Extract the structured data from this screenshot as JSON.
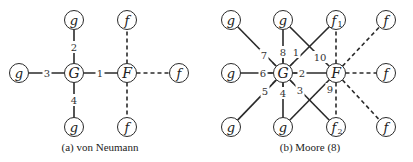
{
  "panels": [
    {
      "id": "a",
      "caption": "(a)  von Neumann",
      "caption_pos": [
        100,
        148
      ],
      "nodes": [
        {
          "id": "g_top",
          "label": "g",
          "x": 74,
          "y": 20
        },
        {
          "id": "g_left",
          "label": "g",
          "x": 19,
          "y": 73
        },
        {
          "id": "G",
          "label": "G",
          "x": 74,
          "y": 73,
          "big": true
        },
        {
          "id": "g_bottom",
          "label": "g",
          "x": 74,
          "y": 127
        },
        {
          "id": "F",
          "label": "F",
          "x": 127,
          "y": 73,
          "big": true
        },
        {
          "id": "f_top",
          "label": "f",
          "x": 127,
          "y": 20
        },
        {
          "id": "f_right",
          "label": "f",
          "x": 179,
          "y": 73
        },
        {
          "id": "f_bottom",
          "label": "f",
          "x": 127,
          "y": 127
        }
      ],
      "edges": [
        {
          "from": "G",
          "to": "F",
          "style": "solid",
          "label": "1",
          "lx": 100,
          "ly": 73
        },
        {
          "from": "G",
          "to": "g_top",
          "style": "solid",
          "label": "2",
          "lx": 74,
          "ly": 47
        },
        {
          "from": "G",
          "to": "g_left",
          "style": "solid",
          "label": "3",
          "lx": 47,
          "ly": 73
        },
        {
          "from": "G",
          "to": "g_bottom",
          "style": "solid",
          "label": "4",
          "lx": 74,
          "ly": 100
        },
        {
          "from": "F",
          "to": "f_top",
          "style": "dashed"
        },
        {
          "from": "F",
          "to": "f_right",
          "style": "dashed"
        },
        {
          "from": "F",
          "to": "f_bottom",
          "style": "dashed"
        }
      ]
    },
    {
      "id": "b",
      "caption": "(b)  Moore (8)",
      "caption_pos": [
        310,
        148
      ],
      "nodes": [
        {
          "id": "g_tl",
          "label": "g",
          "x": 231,
          "y": 20
        },
        {
          "id": "g_tm",
          "label": "g",
          "x": 283,
          "y": 20
        },
        {
          "id": "f1",
          "label": "f",
          "sub": "1",
          "x": 336,
          "y": 20
        },
        {
          "id": "f_tr",
          "label": "f",
          "x": 386,
          "y": 20
        },
        {
          "id": "g_ml",
          "label": "g",
          "x": 231,
          "y": 73
        },
        {
          "id": "G",
          "label": "G",
          "x": 283,
          "y": 73,
          "big": true
        },
        {
          "id": "F",
          "label": "F",
          "x": 336,
          "y": 73,
          "big": true
        },
        {
          "id": "f_mr",
          "label": "f",
          "x": 386,
          "y": 73
        },
        {
          "id": "g_bl",
          "label": "g",
          "x": 231,
          "y": 127
        },
        {
          "id": "g_bm",
          "label": "g",
          "x": 283,
          "y": 127
        },
        {
          "id": "f2",
          "label": "f",
          "sub": "2",
          "x": 336,
          "y": 127
        },
        {
          "id": "f_br",
          "label": "f",
          "x": 386,
          "y": 127
        }
      ],
      "edges": [
        {
          "from": "G",
          "to": "f1",
          "style": "solid",
          "label": "1",
          "lx": 296,
          "ly": 52
        },
        {
          "from": "G",
          "to": "F",
          "style": "solid",
          "label": "2",
          "lx": 302,
          "ly": 73
        },
        {
          "from": "G",
          "to": "f2",
          "style": "solid",
          "label": "3",
          "lx": 300,
          "ly": 90
        },
        {
          "from": "G",
          "to": "g_bm",
          "style": "solid",
          "label": "4",
          "lx": 283,
          "ly": 93
        },
        {
          "from": "G",
          "to": "g_bl",
          "style": "solid",
          "label": "5",
          "lx": 265,
          "ly": 91
        },
        {
          "from": "G",
          "to": "g_ml",
          "style": "solid",
          "label": "6",
          "lx": 263,
          "ly": 73
        },
        {
          "from": "G",
          "to": "g_tl",
          "style": "solid",
          "label": "7",
          "lx": 264,
          "ly": 55
        },
        {
          "from": "G",
          "to": "g_tm",
          "style": "solid",
          "label": "8",
          "lx": 283,
          "ly": 52
        },
        {
          "from": "F",
          "to": "g_bm",
          "style": "solid",
          "label": "9",
          "lx": 330,
          "ly": 89
        },
        {
          "from": "F",
          "to": "g_tm",
          "style": "solid",
          "label": "10",
          "lx": 320,
          "ly": 57
        },
        {
          "from": "F",
          "to": "f1",
          "style": "dashed"
        },
        {
          "from": "F",
          "to": "f_tr",
          "style": "dashed"
        },
        {
          "from": "F",
          "to": "f_mr",
          "style": "dashed"
        },
        {
          "from": "F",
          "to": "f_br",
          "style": "dashed"
        },
        {
          "from": "F",
          "to": "f2",
          "style": "dashed"
        }
      ]
    }
  ]
}
